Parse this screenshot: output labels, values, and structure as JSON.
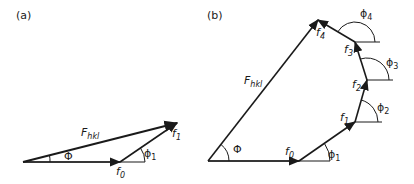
{
  "panels": [
    {
      "label": "(a)",
      "resultant": {
        "symbol": "F",
        "subscript": "hkl"
      },
      "vectors": [
        {
          "symbol": "f",
          "subscript": "0"
        },
        {
          "symbol": "f",
          "subscript": "1"
        }
      ],
      "angles": [
        {
          "symbol": "Φ"
        },
        {
          "symbol": "ϕ",
          "subscript": "1"
        }
      ]
    },
    {
      "label": "(b)",
      "resultant": {
        "symbol": "F",
        "subscript": "hkl"
      },
      "vectors": [
        {
          "symbol": "f",
          "subscript": "0"
        },
        {
          "symbol": "f",
          "subscript": "1"
        },
        {
          "symbol": "f",
          "subscript": "2"
        },
        {
          "symbol": "f",
          "subscript": "3"
        },
        {
          "symbol": "f",
          "subscript": "4"
        }
      ],
      "angles": [
        {
          "symbol": "Φ"
        },
        {
          "symbol": "ϕ",
          "subscript": "1"
        },
        {
          "symbol": "ϕ",
          "subscript": "2"
        },
        {
          "symbol": "ϕ",
          "subscript": "3"
        },
        {
          "symbol": "ϕ",
          "subscript": "4"
        }
      ]
    }
  ],
  "colors": {
    "stroke": "#1a1a1a",
    "background": "#ffffff"
  }
}
